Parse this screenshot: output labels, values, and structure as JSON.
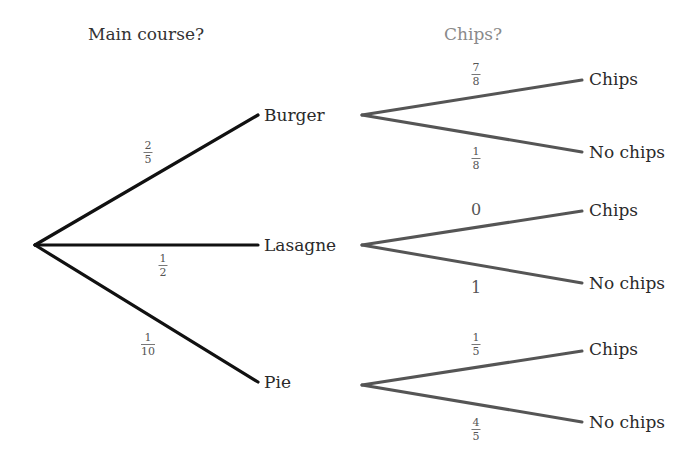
{
  "headers": {
    "stage1": "Main course?",
    "stage2": "Chips?"
  },
  "colors": {
    "stage1_line": "#111111",
    "stage2_line": "#555555",
    "header1": "#333333",
    "header2": "#8a8a8a",
    "background": "#ffffff"
  },
  "stage1": [
    {
      "label": "Burger",
      "probability": {
        "num": "2",
        "den": "5"
      }
    },
    {
      "label": "Lasagne",
      "probability": {
        "num": "1",
        "den": "2"
      }
    },
    {
      "label": "Pie",
      "probability": {
        "num": "1",
        "den": "10"
      }
    }
  ],
  "stage2": {
    "burger": [
      {
        "label": "Chips",
        "probability": {
          "num": "7",
          "den": "8"
        }
      },
      {
        "label": "No chips",
        "probability": {
          "num": "1",
          "den": "8"
        }
      }
    ],
    "lasagne": [
      {
        "label": "Chips",
        "probability": "0"
      },
      {
        "label": "No chips",
        "probability": "1"
      }
    ],
    "pie": [
      {
        "label": "Chips",
        "probability": {
          "num": "1",
          "den": "5"
        }
      },
      {
        "label": "No chips",
        "probability": {
          "num": "4",
          "den": "5"
        }
      }
    ]
  }
}
